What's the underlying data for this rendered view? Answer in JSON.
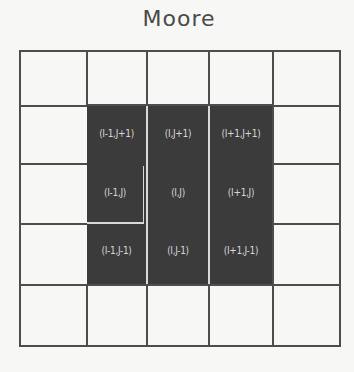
{
  "title": "Moore",
  "grid": {
    "rows": 5,
    "cols": 5,
    "col_lines_x": [
      19,
      86,
      146,
      208,
      272,
      340
    ],
    "row_lines_y": [
      50,
      105,
      163,
      223,
      284,
      345
    ],
    "line_color": "#4d4d4d",
    "cell_fill": "#f7f7f5"
  },
  "neighborhood": {
    "fill_color": "#3b3b3b",
    "label_color": "#d6d6d6",
    "cells": [
      {
        "label": "(I-1,J+1)",
        "row": 1,
        "col": 1
      },
      {
        "label": "(I,J+1)",
        "row": 1,
        "col": 2
      },
      {
        "label": "(I+1,J+1)",
        "row": 1,
        "col": 3
      },
      {
        "label": "(I-1,J)",
        "row": 2,
        "col": 1
      },
      {
        "label": "(I,J)",
        "row": 2,
        "col": 2
      },
      {
        "label": "(I+1,J)",
        "row": 2,
        "col": 3
      },
      {
        "label": "(I-1,J-1)",
        "row": 3,
        "col": 1
      },
      {
        "label": "(I,J-1)",
        "row": 3,
        "col": 2
      },
      {
        "label": "(I+1,J-1)",
        "row": 3,
        "col": 3
      }
    ]
  }
}
